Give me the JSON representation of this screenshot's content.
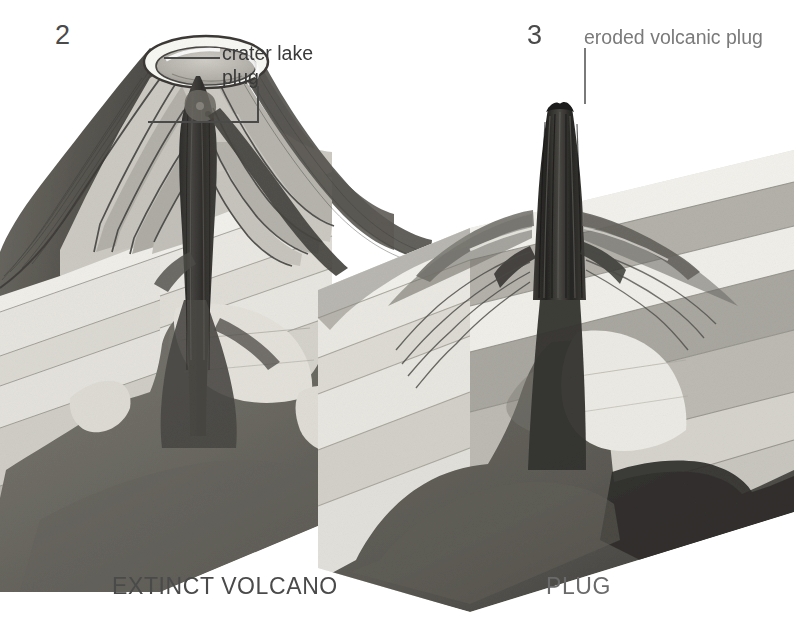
{
  "figure": {
    "background_color": "#ffffff",
    "style": "grayscale cutaway block diagram"
  },
  "panels": [
    {
      "number": "2",
      "caption": "EXTINCT VOLCANO",
      "callouts": [
        {
          "text": "crater lake",
          "leader": "horizontal-to-crater"
        },
        {
          "text": "plug",
          "leader": "elbow-down-then-left-to-conduit"
        }
      ]
    },
    {
      "number": "3",
      "caption": "PLUG",
      "callouts": [
        {
          "text": "eroded volcanic plug",
          "leader": "vertical-down-to-spire"
        }
      ]
    }
  ],
  "palette": {
    "paper": "#ffffff",
    "stratum_pale": "#f2f1ed",
    "stratum_light": "#dedcd6",
    "stratum_mid": "#b4b2ab",
    "stratum_dark": "#8d8b84",
    "cone_dark": "#595751",
    "magma": "#6f6d67",
    "magma_deep": "#4e4c47",
    "plug_black": "#33322f",
    "ink": "#3a3a3a",
    "rim_white": "#fafaf7"
  },
  "geology": {
    "layers_left_front": [
      "pale",
      "light",
      "mid",
      "light",
      "mid"
    ],
    "layers_right_front": [
      "pale",
      "mid",
      "light",
      "mid",
      "light"
    ],
    "features": [
      "crater with white rim",
      "layered ash and lava flows on cone flanks",
      "central conduit plug",
      "magma chamber",
      "radiating dikes",
      "bedded sedimentary country rock"
    ]
  }
}
